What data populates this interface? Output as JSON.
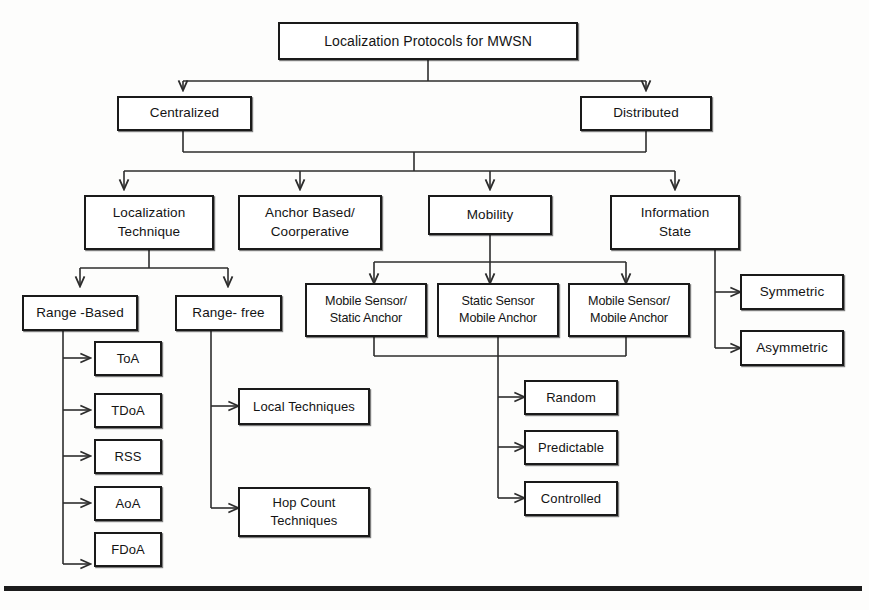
{
  "diagram": {
    "title": "Localization Protocols for MWSN",
    "type": "tree-taxonomy",
    "root": {
      "id": "root",
      "label": "Localization Protocols for MWSN"
    },
    "level2": [
      {
        "id": "centralized",
        "label": "Centralized"
      },
      {
        "id": "distributed",
        "label": "Distributed"
      }
    ],
    "level3": [
      {
        "id": "localization-technique",
        "label": "Localization\nTechnique"
      },
      {
        "id": "anchor-based",
        "label": "Anchor Based/\nCoorperative"
      },
      {
        "id": "mobility",
        "label": "Mobility"
      },
      {
        "id": "information-state",
        "label": "Information\nState"
      }
    ],
    "level4": [
      {
        "id": "range-based",
        "label": "Range -Based"
      },
      {
        "id": "range-free",
        "label": "Range- free"
      },
      {
        "id": "mobile-static",
        "label": "Mobile Sensor/\nStatic Anchor"
      },
      {
        "id": "static-mobile",
        "label": "Static Sensor\nMobile Anchor"
      },
      {
        "id": "mobile-mobile",
        "label": "Mobile Sensor/\nMobile Anchor"
      },
      {
        "id": "symmetric",
        "label": "Symmetric"
      },
      {
        "id": "asymmetric",
        "label": "Asymmetric"
      }
    ],
    "range_based_children": [
      {
        "id": "toa",
        "label": "ToA"
      },
      {
        "id": "tdoa",
        "label": "TDoA"
      },
      {
        "id": "rss",
        "label": "RSS"
      },
      {
        "id": "aoa",
        "label": "AoA"
      },
      {
        "id": "fdoa",
        "label": "FDoA"
      }
    ],
    "range_free_children": [
      {
        "id": "local-techniques",
        "label": "Local Techniques"
      },
      {
        "id": "hop-count-techniques",
        "label": "Hop Count\nTechniques"
      }
    ],
    "mobility_pattern_children": [
      {
        "id": "random",
        "label": "Random"
      },
      {
        "id": "predictable",
        "label": "Predictable"
      },
      {
        "id": "controlled",
        "label": "Controlled"
      }
    ],
    "colors": {
      "box_border": "#1a1a1a",
      "box_fill": "#ffffff",
      "connector": "#2d2d2d",
      "text": "#141414",
      "rule": "#1c1c1c",
      "page_background": "#fdfdfc"
    }
  }
}
